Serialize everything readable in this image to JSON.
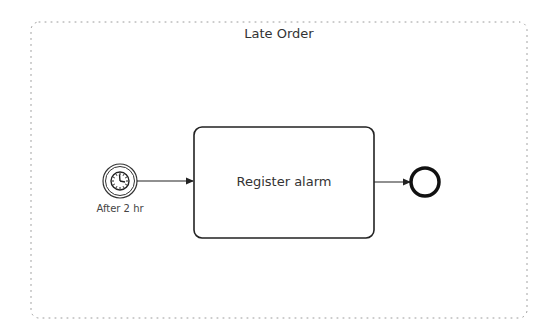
{
  "subprocess": {
    "title": "Late Order",
    "border_style": "dotted",
    "border_color": "#9a9a9a"
  },
  "timer_start_event": {
    "icon": "clock-icon",
    "label": "After 2 hr"
  },
  "task": {
    "label": "Register alarm"
  },
  "end_event": {
    "icon": "end-circle-icon"
  },
  "flows": [
    {
      "from": "timer_start_event",
      "to": "task"
    },
    {
      "from": "task",
      "to": "end_event"
    }
  ],
  "colors": {
    "stroke": "#222222",
    "text": "#333333",
    "background": "#ffffff"
  }
}
